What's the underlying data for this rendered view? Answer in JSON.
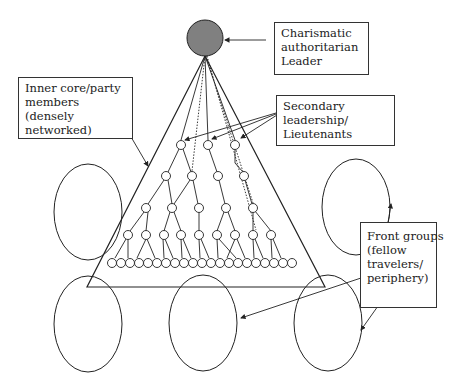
{
  "diagram": {
    "type": "organizational-structure",
    "labels": {
      "leader": [
        "Charismatic",
        "authoritarian",
        "Leader"
      ],
      "secondary": [
        "Secondary",
        "leadership/",
        "Lieutenants"
      ],
      "inner_core": [
        "Inner core/party",
        "members",
        "(densely",
        "networked)"
      ],
      "front_groups": [
        "Front groups",
        "(fellow",
        "travelers/",
        "periphery)"
      ]
    },
    "colors": {
      "leader_fill": "#808080",
      "stroke": "#222222",
      "background": "#ffffff"
    },
    "nodes": {
      "leader": {
        "cx": 205,
        "cy": 38,
        "r": 18
      },
      "level1": [
        [
          181,
          145
        ],
        [
          208,
          145
        ],
        [
          235,
          145
        ]
      ],
      "level2": [
        [
          166,
          176
        ],
        [
          192,
          176
        ],
        [
          218,
          176
        ],
        [
          244,
          176
        ]
      ],
      "level3": [
        [
          146,
          208
        ],
        [
          172,
          208
        ],
        [
          199,
          208
        ],
        [
          226,
          208
        ],
        [
          253,
          208
        ]
      ],
      "level4": [
        [
          128,
          235
        ],
        [
          146,
          235
        ],
        [
          164,
          235
        ],
        [
          181,
          235
        ],
        [
          199,
          235
        ],
        [
          217,
          235
        ],
        [
          235,
          235
        ],
        [
          253,
          235
        ],
        [
          271,
          235
        ]
      ],
      "bottom_row_count": 21
    },
    "front_group_ellipses": [
      {
        "cx": 88,
        "cy": 212,
        "rx": 34,
        "ry": 48
      },
      {
        "cx": 356,
        "cy": 207,
        "rx": 34,
        "ry": 48
      },
      {
        "cx": 88,
        "cy": 324,
        "rx": 34,
        "ry": 48
      },
      {
        "cx": 203,
        "cy": 323,
        "rx": 34,
        "ry": 48
      },
      {
        "cx": 328,
        "cy": 323,
        "rx": 34,
        "ry": 48
      }
    ]
  }
}
